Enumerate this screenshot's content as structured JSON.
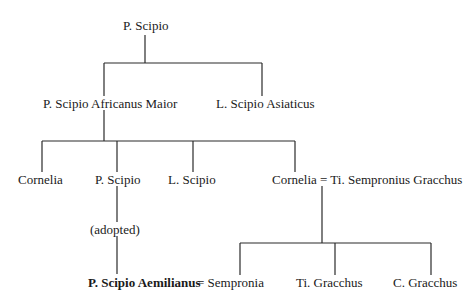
{
  "nodes": {
    "p_scipio_root": "P. Scipio",
    "africanus": "P. Scipio Africanus Maior",
    "asiaticus": "L. Scipio Asiaticus",
    "cornelia1": "Cornelia",
    "p_scipio_child": "P. Scipio",
    "l_scipio": "L. Scipio",
    "cornelia_marriage": "Cornelia = Ti. Sempronius Gracchus",
    "adopted_note": "(adopted)",
    "aemilianus": "P. Scipio Aemilianus",
    "aemilianus_spouse": "= Sempronia",
    "ti_gracchus": "Ti. Gracchus",
    "c_gracchus": "C. Gracchus"
  },
  "colors": {
    "line": "#2a2a2a",
    "text": "#1a1a1a",
    "background": "#ffffff"
  }
}
